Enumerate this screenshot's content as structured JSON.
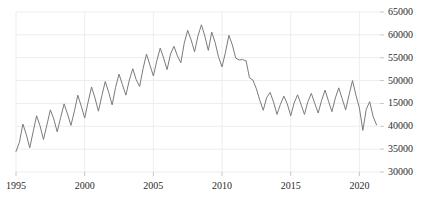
{
  "chart_data": {
    "type": "line",
    "title": "",
    "subtitle": "",
    "xlabel": "",
    "ylabel": "",
    "xlim": [
      1995.0,
      2021.5
    ],
    "ylim": [
      30000,
      65000
    ],
    "grid": true,
    "legend": false,
    "legend_position": "none",
    "y_axis_side": "right",
    "line_color": "#7b7b7b",
    "grid_color": "#ededed",
    "background_color": "#ffffff",
    "text_color": "#2b2b2b",
    "y_ticks": [
      30000,
      35000,
      40000,
      45000,
      50000,
      55000,
      60000,
      65000
    ],
    "y_tick_labels": [
      "30000",
      "35000",
      "40000",
      "15000",
      "50000",
      "55000",
      "60000",
      "65000"
    ],
    "x_ticks": [
      1995,
      2000,
      2005,
      2010,
      2015,
      2020
    ],
    "x_tick_labels": [
      "1995",
      "2000",
      "2005",
      "2010",
      "2015",
      "2020"
    ],
    "series": [
      {
        "name": "series-1",
        "color": "#7b7b7b",
        "x": [
          1995.0,
          1995.25,
          1995.5,
          1995.75,
          1996.0,
          1996.25,
          1996.5,
          1996.75,
          1997.0,
          1997.25,
          1997.5,
          1997.75,
          1998.0,
          1998.25,
          1998.5,
          1998.75,
          1999.0,
          1999.25,
          1999.5,
          1999.75,
          2000.0,
          2000.25,
          2000.5,
          2000.75,
          2001.0,
          2001.25,
          2001.5,
          2001.75,
          2002.0,
          2002.25,
          2002.5,
          2002.75,
          2003.0,
          2003.25,
          2003.5,
          2003.75,
          2004.0,
          2004.25,
          2004.5,
          2004.75,
          2005.0,
          2005.25,
          2005.5,
          2005.75,
          2006.0,
          2006.25,
          2006.5,
          2006.75,
          2007.0,
          2007.25,
          2007.5,
          2007.75,
          2008.0,
          2008.25,
          2008.5,
          2008.75,
          2009.0,
          2009.25,
          2009.5,
          2009.75,
          2010.0,
          2010.25,
          2010.5,
          2010.75,
          2011.0,
          2011.25,
          2011.5,
          2011.75,
          2012.0,
          2012.25,
          2012.5,
          2012.75,
          2013.0,
          2013.25,
          2013.5,
          2013.75,
          2014.0,
          2014.25,
          2014.5,
          2014.75,
          2015.0,
          2015.25,
          2015.5,
          2015.75,
          2016.0,
          2016.25,
          2016.5,
          2016.75,
          2017.0,
          2017.25,
          2017.5,
          2017.75,
          2018.0,
          2018.25,
          2018.5,
          2018.75,
          2019.0,
          2019.25,
          2019.5,
          2019.75,
          2020.0,
          2020.25,
          2020.5,
          2020.75,
          2021.0,
          2021.25
        ],
        "values": [
          34500,
          36500,
          40500,
          38200,
          35300,
          38800,
          42300,
          40100,
          37100,
          40300,
          43600,
          41600,
          38800,
          41900,
          44900,
          42700,
          40200,
          43300,
          46800,
          44400,
          41800,
          45300,
          48600,
          46200,
          43300,
          46700,
          49800,
          47400,
          44700,
          48500,
          51400,
          49100,
          46800,
          50100,
          52600,
          50200,
          48700,
          52600,
          55800,
          53400,
          51000,
          54300,
          57100,
          54900,
          52400,
          55800,
          57500,
          55400,
          53900,
          58200,
          61000,
          58900,
          56300,
          59800,
          62200,
          59700,
          56600,
          60600,
          58300,
          55100,
          53000,
          56200,
          59900,
          57800,
          54900,
          54500,
          54600,
          54300,
          50600,
          50100,
          48200,
          45700,
          43500,
          46300,
          47400,
          45300,
          42600,
          44800,
          46600,
          44900,
          42300,
          45100,
          46900,
          44800,
          42600,
          45400,
          47200,
          45000,
          42900,
          45700,
          47900,
          45500,
          43200,
          46200,
          48400,
          46000,
          43600,
          46900,
          50000,
          46800,
          44000,
          39100,
          43700,
          45400,
          42100,
          40300
        ]
      }
    ],
    "annotations": [
      {
        "label": "series-start",
        "x": 1995.0,
        "y": 34500
      },
      {
        "label": "peak",
        "x": 2008.5,
        "y": 62200
      },
      {
        "label": "trough",
        "x": 2020.25,
        "y": 39100
      },
      {
        "label": "series-end",
        "x": 2021.25,
        "y": 40300
      }
    ]
  },
  "plot_geometry": {
    "left": 16,
    "right": 380,
    "top": 12,
    "bottom": 172
  }
}
